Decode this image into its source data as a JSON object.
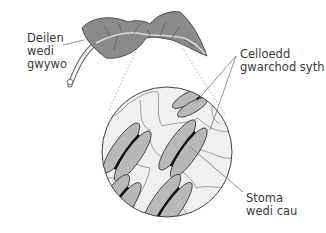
{
  "diagram": {
    "type": "biology-illustration",
    "labels": {
      "wilted_leaf": {
        "line1": "Deilen",
        "line2": "wedi",
        "line3": "gwywo"
      },
      "guard_cells": {
        "line1": "Celloedd",
        "line2": "gwarchod syth"
      },
      "closed_stoma": {
        "line1": "Stoma",
        "line2": "wedi cau"
      }
    },
    "colors": {
      "leaf_fill": "#8a8a8a",
      "leaf_vein": "#555555",
      "cell_fill": "#f0f0f0",
      "cell_wall": "#8a8a8a",
      "guard_cell_fill": "#b8b8b8",
      "stoma_pore": "#1a1a1a",
      "outline": "#444444",
      "leader_line": "#777777",
      "text": "#3a3a3a"
    }
  }
}
